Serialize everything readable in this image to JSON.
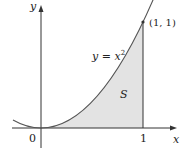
{
  "figure": {
    "curve_label": "y = x²",
    "curve_label_lhs": "y",
    "curve_label_eq": "=",
    "curve_label_x": "x",
    "curve_label_exp": "2",
    "region_label": "S",
    "point_label": "(1, 1)",
    "axis_x_label": "x",
    "axis_y_label": "y",
    "origin_label": "0",
    "tick_x1_label": "1",
    "colors": {
      "curve": "#555555",
      "fill": "#e3e3e3",
      "axis": "#333333"
    }
  }
}
